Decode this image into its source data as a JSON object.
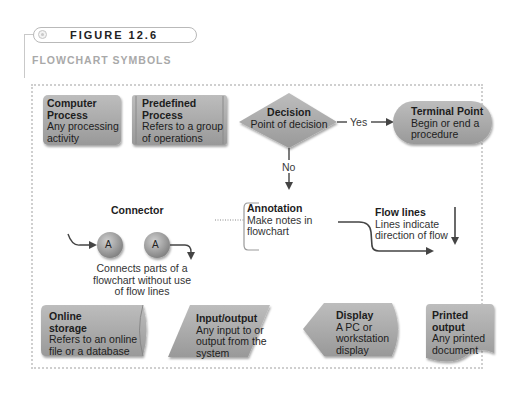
{
  "figure": {
    "label": "FIGURE 12.6",
    "title": "FLOWCHART SYMBOLS"
  },
  "symbols": {
    "computer_process": {
      "name": "Computer Process",
      "name_line1": "Computer",
      "name_line2": "Process",
      "desc_line1": "Any processing",
      "desc_line2": "activity"
    },
    "predefined_process": {
      "name_line1": "Predefined",
      "name_line2": "Process",
      "desc_line1": "Refers to a group",
      "desc_line2": "of operations"
    },
    "decision": {
      "name": "Decision",
      "desc": "Point of decision",
      "yes_label": "Yes",
      "no_label": "No"
    },
    "terminal_point": {
      "name": "Terminal Point",
      "desc_line1": "Begin or end a",
      "desc_line2": "procedure"
    },
    "connector": {
      "name": "Connector",
      "letter": "A",
      "desc_line1": "Connects parts of a",
      "desc_line2": "flowchart without use",
      "desc_line3": "of flow lines"
    },
    "annotation": {
      "name": "Annotation",
      "desc_line1": "Make notes in",
      "desc_line2": "flowchart"
    },
    "flow_lines": {
      "name": "Flow lines",
      "desc_line1": "Lines indicate",
      "desc_line2": "direction of flow"
    },
    "online_storage": {
      "name_line1": "Online",
      "name_line2": "storage",
      "desc_line1": "Refers to an online",
      "desc_line2": "file or a database"
    },
    "input_output": {
      "name": "Input/output",
      "desc_line1": "Any input to or",
      "desc_line2": "output from the",
      "desc_line3": "system"
    },
    "display": {
      "name": "Display",
      "desc_line1": "A PC or",
      "desc_line2": "workstation",
      "desc_line3": "display"
    },
    "printed_output": {
      "name_line1": "Printed",
      "name_line2": "output",
      "desc_line1": "Any printed",
      "desc_line2": "document"
    }
  },
  "colors": {
    "shape_fill_light": "#b9b9b9",
    "shape_fill_dark": "#9c9c9c",
    "frame_dots": "#cfcfcf",
    "arrow": "#444444",
    "subtitle": "#a9a9a9"
  }
}
